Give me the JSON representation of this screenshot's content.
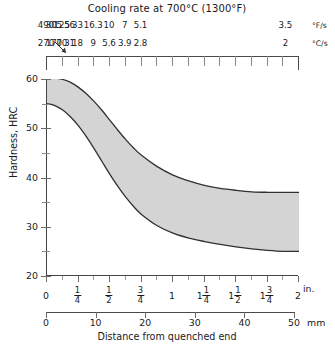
{
  "chart_title": "Cooling rate at 700°C (1300°F)",
  "units": {
    "fahrenheit": "°F/s",
    "celsius": "°C/s"
  },
  "axes": {
    "y_title": "Hardness, HRC",
    "x_title": "Distance from quenched end",
    "x_unit_inches": "in.",
    "x_unit_mm": "mm"
  },
  "chart_data": {
    "type": "area",
    "title": "Cooling rate at 700°C (1300°F)",
    "subtitle": "Jominy hardenability band",
    "xlabel": "Distance from quenched end",
    "ylabel": "Hardness, HRC",
    "xlim_in": [
      0,
      2
    ],
    "xlim_mm": [
      0,
      50.8
    ],
    "ylim": [
      20,
      60
    ],
    "grid": false,
    "legend": "none",
    "y_ticks_major": [
      20,
      30,
      40,
      50,
      60
    ],
    "y_ticks_minor": [
      25,
      35,
      45,
      55
    ],
    "x_ticks_in": [
      0,
      0.25,
      0.5,
      0.75,
      1.0,
      1.25,
      1.5,
      1.75,
      2.0
    ],
    "x_tick_labels_in": [
      "0",
      "1/4",
      "1/2",
      "3/4",
      "1",
      "1 1/4",
      "1 1/2",
      "1 3/4",
      "2"
    ],
    "x_ticks_mm": [
      0,
      10,
      20,
      30,
      40,
      50
    ],
    "x_tick_labels_mm": [
      "0",
      "10",
      "20",
      "30",
      "40",
      "50"
    ],
    "cooling_rate_F_per_s": [
      "490",
      "305",
      "125",
      "56",
      "33",
      "16.3",
      "10",
      "7",
      "5.1",
      "3.5"
    ],
    "cooling_rate_C_per_s": [
      "270",
      "170",
      "70",
      "31",
      "18",
      "9",
      "5.6",
      "3.9",
      "2.8",
      "2"
    ],
    "cooling_rate_x_in": [
      0.0,
      0.0625,
      0.125,
      0.1875,
      0.25,
      0.375,
      0.5,
      0.625,
      0.75,
      1.9
    ],
    "series": [
      {
        "name": "Maximum hardness (upper bound)",
        "x_in": [
          0.0,
          0.0625,
          0.125,
          0.1875,
          0.25,
          0.3125,
          0.375,
          0.4375,
          0.5,
          0.5625,
          0.625,
          0.6875,
          0.75,
          0.875,
          1.0,
          1.125,
          1.25,
          1.375,
          1.5,
          1.625,
          1.75,
          1.875,
          2.0
        ],
        "values": [
          60.2,
          60.2,
          59.9,
          59.3,
          58.3,
          57.0,
          55.4,
          53.6,
          51.6,
          49.6,
          47.7,
          46.0,
          44.5,
          42.2,
          40.5,
          39.3,
          38.4,
          37.8,
          37.4,
          37.1,
          37.0,
          37.0,
          37.0
        ]
      },
      {
        "name": "Minimum hardness (lower bound)",
        "x_in": [
          0.0,
          0.0625,
          0.125,
          0.1875,
          0.25,
          0.3125,
          0.375,
          0.4375,
          0.5,
          0.5625,
          0.625,
          0.6875,
          0.75,
          0.875,
          1.0,
          1.125,
          1.25,
          1.375,
          1.5,
          1.625,
          1.75,
          1.875,
          2.0
        ],
        "values": [
          55.0,
          54.6,
          53.7,
          52.3,
          50.5,
          48.3,
          45.8,
          43.2,
          40.6,
          38.2,
          36.0,
          34.1,
          32.5,
          30.2,
          28.7,
          27.7,
          27.0,
          26.4,
          25.9,
          25.5,
          25.2,
          25.0,
          25.0
        ]
      }
    ],
    "band_fill_color": "#d4d4d4",
    "band_edge_color": "#303030"
  }
}
